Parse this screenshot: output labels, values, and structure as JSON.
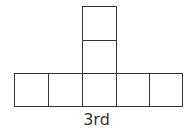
{
  "diagram": {
    "type": "cube-net",
    "label": "3rd",
    "line_color": "#333333",
    "cells": [
      {
        "id": "top-1",
        "col": 2,
        "row": 0
      },
      {
        "id": "top-2",
        "col": 2,
        "row": 1
      },
      {
        "id": "bottom-1",
        "col": 0,
        "row": 2
      },
      {
        "id": "bottom-2",
        "col": 1,
        "row": 2
      },
      {
        "id": "bottom-3",
        "col": 2,
        "row": 2
      },
      {
        "id": "bottom-4",
        "col": 3,
        "row": 2
      },
      {
        "id": "bottom-5",
        "col": 4,
        "row": 2
      }
    ]
  }
}
